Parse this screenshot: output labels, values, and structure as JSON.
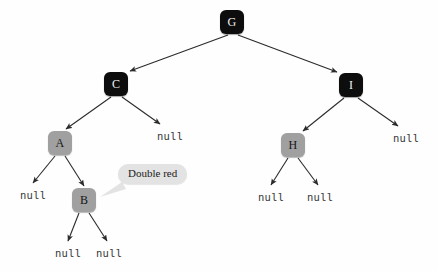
{
  "diagram": {
    "type": "red-black-tree",
    "background_color": "#fefefe",
    "black_node_color": "#0d0d0d",
    "red_node_color": "#a0a0a0",
    "edge_color": "#2b2b2b",
    "callout_color": "#e3e3e3",
    "nodes": [
      {
        "id": "G",
        "label": "G",
        "color": "black",
        "x": 220,
        "y": 10
      },
      {
        "id": "C",
        "label": "C",
        "color": "black",
        "x": 104,
        "y": 72
      },
      {
        "id": "I",
        "label": "I",
        "color": "black",
        "x": 339,
        "y": 73
      },
      {
        "id": "A",
        "label": "A",
        "color": "red",
        "x": 48,
        "y": 131
      },
      {
        "id": "H",
        "label": "H",
        "color": "red",
        "x": 281,
        "y": 133
      },
      {
        "id": "B",
        "label": "B",
        "color": "red",
        "x": 72,
        "y": 188
      }
    ],
    "null_leaves": [
      {
        "id": "null-c-right",
        "label": "null",
        "x": 157,
        "y": 130
      },
      {
        "id": "null-i-right",
        "label": "null",
        "x": 393,
        "y": 132
      },
      {
        "id": "null-a-left",
        "label": "null",
        "x": 20,
        "y": 189
      },
      {
        "id": "null-h-left",
        "label": "null",
        "x": 258,
        "y": 191
      },
      {
        "id": "null-h-right",
        "label": "null",
        "x": 307,
        "y": 191
      },
      {
        "id": "null-b-left",
        "label": "null",
        "x": 55,
        "y": 247
      },
      {
        "id": "null-b-right",
        "label": "null",
        "x": 96,
        "y": 247
      }
    ],
    "callout": {
      "id": "double-red-callout",
      "text": "Double red",
      "x": 118,
      "y": 164
    },
    "edges": [
      {
        "from": "G",
        "to": "C",
        "x1": 228,
        "y1": 35,
        "x2": 130,
        "y2": 71
      },
      {
        "from": "G",
        "to": "I",
        "x1": 238,
        "y1": 35,
        "x2": 337,
        "y2": 72
      },
      {
        "from": "C",
        "to": "A",
        "x1": 111,
        "y1": 97,
        "x2": 66,
        "y2": 129
      },
      {
        "from": "C",
        "to": "null-c-right",
        "x1": 122,
        "y1": 97,
        "x2": 160,
        "y2": 124
      },
      {
        "from": "I",
        "to": "H",
        "x1": 344,
        "y1": 98,
        "x2": 303,
        "y2": 131
      },
      {
        "from": "I",
        "to": "null-i-right",
        "x1": 358,
        "y1": 98,
        "x2": 398,
        "y2": 126
      },
      {
        "from": "A",
        "to": "null-a-left",
        "x1": 55,
        "y1": 156,
        "x2": 33,
        "y2": 183
      },
      {
        "from": "A",
        "to": "B",
        "x1": 65,
        "y1": 156,
        "x2": 84,
        "y2": 186
      },
      {
        "from": "H",
        "to": "null-h-left",
        "x1": 288,
        "y1": 158,
        "x2": 271,
        "y2": 185
      },
      {
        "from": "H",
        "to": "null-h-right",
        "x1": 298,
        "y1": 158,
        "x2": 318,
        "y2": 185
      },
      {
        "from": "B",
        "to": "null-b-left",
        "x1": 79,
        "y1": 213,
        "x2": 68,
        "y2": 241
      },
      {
        "from": "B",
        "to": "null-b-right",
        "x1": 89,
        "y1": 213,
        "x2": 107,
        "y2": 241
      }
    ]
  }
}
